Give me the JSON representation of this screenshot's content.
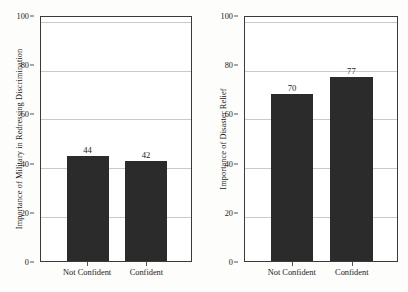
{
  "chart_data": [
    {
      "type": "bar",
      "title": "",
      "xlabel": "",
      "ylabel": "Importance of Military in Redressing Discrimination",
      "categories": [
        "Not Confident",
        "Confident"
      ],
      "values": [
        44,
        42
      ],
      "ylim": [
        0,
        100
      ],
      "yticks": [
        0,
        20,
        40,
        60,
        80,
        100
      ],
      "ytick_labels": [
        "0",
        "20",
        "40",
        "60",
        "80",
        "100"
      ],
      "value_labels": [
        "44",
        "42"
      ],
      "grid": "horizontal",
      "legend": "none",
      "bar_color": "#2b2b2b"
    },
    {
      "type": "bar",
      "title": "",
      "xlabel": "",
      "ylabel": "Importance of Disaster Relief",
      "categories": [
        "Not Confident",
        "Confident"
      ],
      "values": [
        70,
        77
      ],
      "ylim": [
        0,
        100
      ],
      "yticks": [
        0,
        20,
        40,
        60,
        80,
        100
      ],
      "ytick_labels": [
        "0",
        "20",
        "40",
        "60",
        "80",
        "100"
      ],
      "value_labels": [
        "70",
        "77"
      ],
      "grid": "horizontal",
      "legend": "none",
      "bar_color": "#2b2b2b"
    }
  ]
}
